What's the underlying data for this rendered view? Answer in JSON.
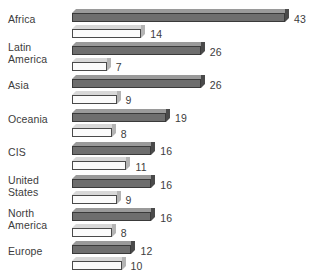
{
  "chart_data": {
    "type": "bar",
    "orientation": "horizontal",
    "title": "",
    "subtitle": "",
    "xlabel": "",
    "ylabel": "",
    "grid": false,
    "legend": "none",
    "axis_visible": false,
    "xlim": [
      0,
      43
    ],
    "categories": [
      "Africa",
      "Latin\nAmerica",
      "Asia",
      "Oceania",
      "CIS",
      "United\nStates",
      "North\nAmerica",
      "Europe"
    ],
    "series": [
      {
        "name": "series-1",
        "color": "#6e6e6e",
        "values": [
          43,
          26,
          26,
          19,
          16,
          16,
          16,
          12
        ]
      },
      {
        "name": "series-2",
        "color": "#fbfbfb",
        "values": [
          14,
          7,
          9,
          8,
          11,
          9,
          8,
          10
        ]
      }
    ],
    "value_labels": [
      [
        "43",
        "14"
      ],
      [
        "26",
        "7"
      ],
      [
        "26",
        "9"
      ],
      [
        "19",
        "8"
      ],
      [
        "16",
        "11"
      ],
      [
        "16",
        "9"
      ],
      [
        "16",
        "8"
      ],
      [
        "12",
        "10"
      ]
    ]
  },
  "colors": {
    "background": "#ffffff",
    "text": "#3c3c3c",
    "series1_front": "#6e6e6e",
    "series1_top": "#9a9a9a",
    "series1_side": "#4a4a4a",
    "series1_outline": "#3a3a3a",
    "series2_front": "#fbfbfb",
    "series2_top": "#d8d8d8",
    "series2_side": "#b4b4b4",
    "series2_outline": "#4a4a4a"
  }
}
